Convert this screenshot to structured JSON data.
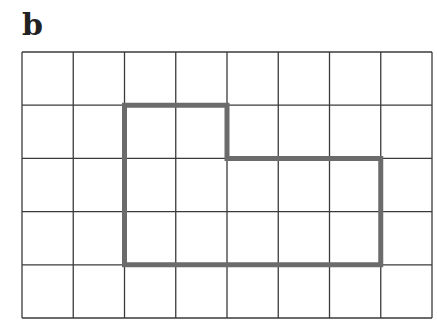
{
  "label": "b",
  "grid": {
    "cols": 8,
    "rows": 5,
    "x0": 22,
    "y0": 52,
    "x1": 432,
    "y1": 318,
    "line_color": "#3a3a3a"
  },
  "shape": {
    "description": "Rectilinear L-shaped outline on grid",
    "vertices_grid": [
      [
        2,
        1
      ],
      [
        4,
        1
      ],
      [
        4,
        2
      ],
      [
        7,
        2
      ],
      [
        7,
        4
      ],
      [
        2,
        4
      ]
    ],
    "stroke_color": "#6b6b6b",
    "stroke_width": 5
  }
}
